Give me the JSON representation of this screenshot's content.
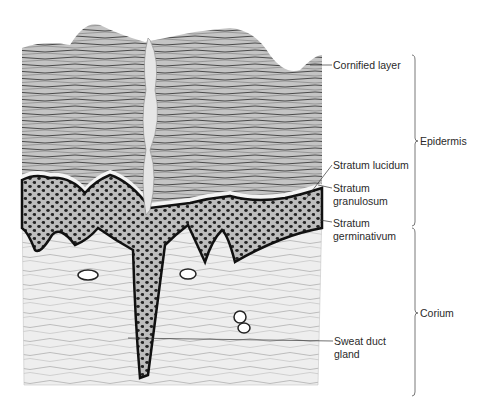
{
  "figure": {
    "background": "#ffffff",
    "ink_color": "#2a2a2a",
    "labels": [
      {
        "id": "cornified",
        "lines": [
          "Cornified layer"
        ],
        "x": 333,
        "y": 59
      },
      {
        "id": "lucidum",
        "lines": [
          "Stratum lucidum"
        ],
        "x": 333,
        "y": 159
      },
      {
        "id": "granulosum",
        "lines": [
          "Stratum",
          "granulosum"
        ],
        "x": 333,
        "y": 182
      },
      {
        "id": "germinativum",
        "lines": [
          "Stratum",
          "germinativum"
        ],
        "x": 333,
        "y": 217
      },
      {
        "id": "sweat",
        "lines": [
          "Sweat duct",
          "gland"
        ],
        "x": 334,
        "y": 335
      }
    ],
    "regions": [
      {
        "id": "epidermis",
        "label": "Epidermis",
        "bracket_top": 55,
        "bracket_bottom": 226,
        "label_y": 141
      },
      {
        "id": "corium",
        "label": "Corium",
        "bracket_top": 228,
        "bracket_bottom": 396,
        "label_y": 313
      }
    ]
  }
}
